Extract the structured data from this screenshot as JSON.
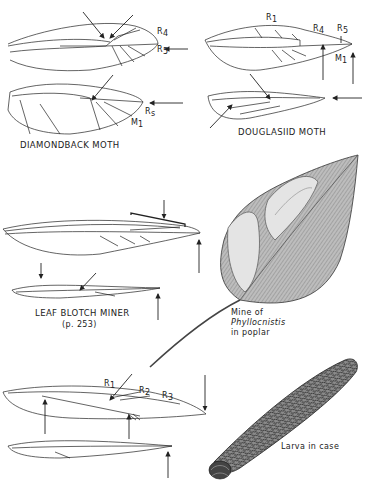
{
  "plate": {
    "figures": [
      {
        "id": "diamondback",
        "caption": "DIAMONDBACK MOTH",
        "vein_labels": [
          "R4",
          "R5",
          "Rs",
          "M1"
        ]
      },
      {
        "id": "douglasiid",
        "caption": "DOUGLASIID MOTH",
        "vein_labels": [
          "R1",
          "R4",
          "R5",
          "M1"
        ]
      },
      {
        "id": "leaf-blotch-miner",
        "caption": "LEAF BLOTCH MINER",
        "page_ref": "(p. 253)"
      },
      {
        "id": "phyllocnistis-mine",
        "caption_line1": "Mine of",
        "caption_line2": "Phyllocnistis",
        "caption_line3": "in poplar"
      },
      {
        "id": "bottom-wings",
        "vein_labels": [
          "R1",
          "R2",
          "R3"
        ]
      },
      {
        "id": "larva-case",
        "caption": "Larva in case"
      }
    ]
  },
  "colors": {
    "ink": "#222222",
    "leaf_fill": "#b9b9b9",
    "mine_fill": "#e6e6e6",
    "case_fill": "#6a6a6a"
  }
}
